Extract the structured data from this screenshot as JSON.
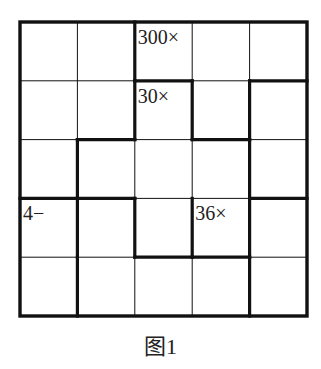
{
  "puzzle": {
    "size": 5,
    "clues": [
      {
        "row": 0,
        "col": 2,
        "text": "300×"
      },
      {
        "row": 1,
        "col": 2,
        "text": "30×"
      },
      {
        "row": 3,
        "col": 0,
        "text": "4−"
      },
      {
        "row": 3,
        "col": 3,
        "text": "36×"
      }
    ],
    "thick_vertical": [
      [
        0,
        2
      ],
      [
        1,
        2
      ],
      [
        1,
        3
      ],
      [
        1,
        4
      ],
      [
        2,
        1
      ],
      [
        2,
        4
      ],
      [
        3,
        1
      ],
      [
        3,
        2
      ],
      [
        3,
        3
      ],
      [
        3,
        4
      ],
      [
        4,
        1
      ],
      [
        4,
        4
      ]
    ],
    "thick_horizontal": [
      [
        1,
        2
      ],
      [
        1,
        4
      ],
      [
        2,
        1
      ],
      [
        2,
        3
      ],
      [
        3,
        0
      ],
      [
        3,
        1
      ],
      [
        3,
        4
      ],
      [
        4,
        2
      ],
      [
        4,
        3
      ]
    ]
  },
  "caption": "图1"
}
